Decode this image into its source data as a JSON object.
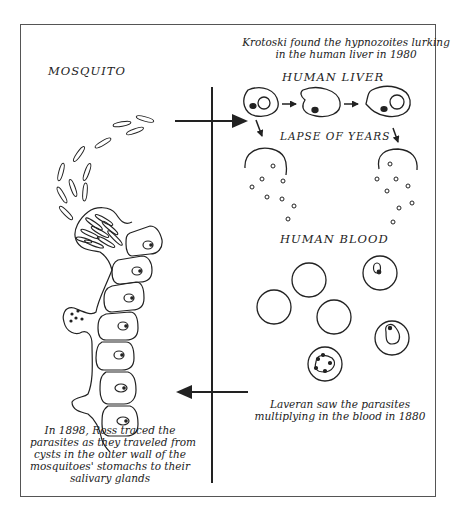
{
  "diagram": {
    "labels": {
      "mosquito": "MOSQUITO",
      "human_liver": "HUMAN LIVER",
      "lapse_of_years": "LAPSE OF YEARS",
      "human_blood": "HUMAN BLOOD"
    },
    "captions": {
      "krotoski": [
        "Krotoski found the hypnozoites lurking",
        "in the human liver in 1980"
      ],
      "laveran": [
        "Laveran saw the parasites",
        "multiplying in the blood in 1880"
      ],
      "ross": [
        "In 1898, Ross traced the",
        "parasites  as they traveled from",
        "cysts in the outer wall of the",
        "mosquitoes' stomachs to their",
        "salivary glands"
      ]
    },
    "arrows": {
      "top": "mosquito-to-liver (right)",
      "bottom": "blood-to-mosquito (left)"
    },
    "colors": {
      "ink": "#222222",
      "frame": "#555555",
      "background": "#ffffff"
    }
  }
}
